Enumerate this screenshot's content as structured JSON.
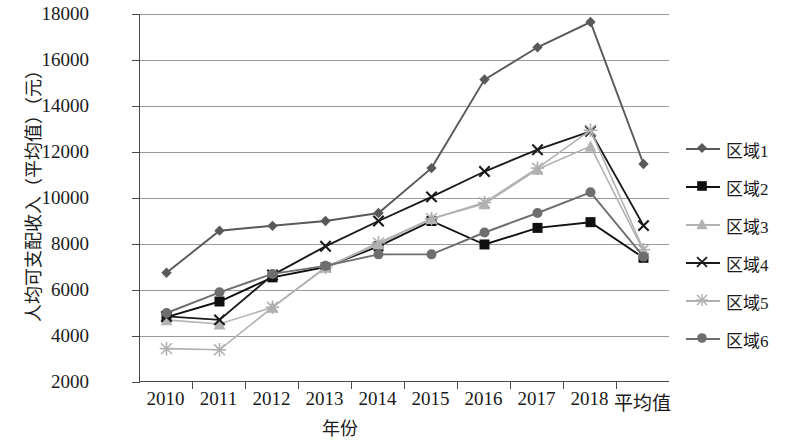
{
  "chart_data": {
    "type": "line",
    "title": "",
    "xlabel": "年份",
    "ylabel": "人均可支配收入（平均值）（元）",
    "categories": [
      "2010",
      "2011",
      "2012",
      "2013",
      "2014",
      "2015",
      "2016",
      "2017",
      "2018",
      "平均值"
    ],
    "ylim": [
      2000,
      18000
    ],
    "ytick_labels": [
      "18000",
      "16000",
      "14000",
      "12000",
      "10000",
      "8000",
      "6000",
      "4000",
      "2000"
    ],
    "ytick_values": [
      18000,
      16000,
      14000,
      12000,
      10000,
      8000,
      6000,
      4000,
      2000
    ],
    "grid": true,
    "legend_position": "right",
    "series": [
      {
        "name": "区域1",
        "marker": "diamond",
        "color": "#595959",
        "values": [
          6750,
          8580,
          8790,
          9000,
          9350,
          11300,
          15150,
          16550,
          17650,
          11480
        ]
      },
      {
        "name": "区域2",
        "marker": "square",
        "color": "#101010",
        "values": [
          4820,
          5500,
          6550,
          7000,
          7900,
          9000,
          7980,
          8700,
          8950,
          7400
        ]
      },
      {
        "name": "区域3",
        "marker": "triangle",
        "color": "#b3b3b3",
        "values": [
          4700,
          4520,
          5250,
          6980,
          8000,
          9100,
          9750,
          11250,
          12250,
          7700
        ]
      },
      {
        "name": "区域4",
        "marker": "x",
        "color": "#1a1a1a",
        "values": [
          4850,
          4700,
          6650,
          7900,
          9000,
          10050,
          11150,
          12100,
          12900,
          8800
        ]
      },
      {
        "name": "区域5",
        "marker": "star",
        "color": "#b0b0b0",
        "values": [
          3450,
          3400,
          5250,
          6980,
          8050,
          9100,
          9800,
          11300,
          12950,
          7750
        ]
      },
      {
        "name": "区域6",
        "marker": "circle",
        "color": "#6e6e6e",
        "values": [
          5000,
          5900,
          6700,
          7050,
          7550,
          7550,
          8500,
          9350,
          10250,
          7450
        ]
      }
    ]
  }
}
